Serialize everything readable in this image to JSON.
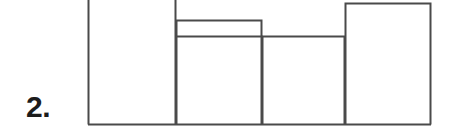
{
  "figure": {
    "item_label": "2.",
    "background_color": "#ffffff",
    "line_color": "#4a4a4a",
    "label_color": "#1c1c1c",
    "width": 453,
    "height": 136
  },
  "chart_data": {
    "type": "bar",
    "title": "",
    "subtitle": "",
    "xlabel": "",
    "ylabel": "",
    "grid": false,
    "legend": null,
    "note": "Adjacent-bar histogram; tops of bars 1 and 2 are cropped off the top edge of the image.",
    "categories": [
      "1",
      "2",
      "3",
      "4"
    ],
    "values": [
      136,
      116,
      100,
      133
    ],
    "bar_tops_y": [
      -4,
      20,
      36,
      3
    ],
    "baseline_y": 124,
    "bar_edges_x": [
      88,
      176,
      262,
      345,
      431
    ],
    "ylim": [
      0,
      140
    ],
    "bars": [
      {
        "index": 1,
        "x_left": 88,
        "x_right": 176,
        "top_y": -4,
        "height": 128,
        "top_cropped": true
      },
      {
        "index": 2,
        "x_left": 176,
        "x_right": 262,
        "top_y": 20,
        "height": 104,
        "top_cropped": false
      },
      {
        "index": 3,
        "x_left": 262,
        "x_right": 345,
        "top_y": 36,
        "height": 88,
        "top_cropped": false
      },
      {
        "index": 4,
        "x_left": 345,
        "x_right": 431,
        "top_y": 3,
        "height": 121,
        "top_cropped": false
      }
    ],
    "extra_rules": [
      {
        "name": "bar2-interior-line",
        "y": 36,
        "x_start": 176,
        "x_end": 262
      }
    ]
  }
}
